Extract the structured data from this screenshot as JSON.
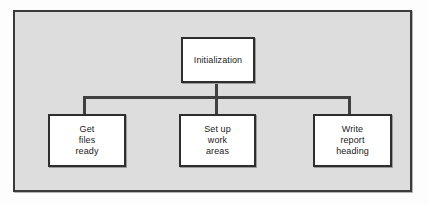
{
  "diagram": {
    "type": "structure-chart",
    "frame": {
      "background_color": "#dddddd",
      "border_color": "#3a3a3a"
    },
    "node_style": {
      "fill_color": "#ffffff",
      "border_color": "#2e2e2e",
      "text_color": "#1a1a1a"
    },
    "connector_color": "#3f3f3f",
    "root": {
      "label": "Initialization"
    },
    "children": [
      {
        "label": "Get\nfiles\nready"
      },
      {
        "label": "Set up\nwork\nareas"
      },
      {
        "label": "Write\nreport\nheading"
      }
    ]
  }
}
